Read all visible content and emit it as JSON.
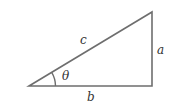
{
  "diagram": {
    "type": "right-triangle",
    "labels": {
      "hypotenuse": "c",
      "opposite": "a",
      "adjacent": "b",
      "angle": "θ"
    },
    "stroke_color": "#6e6e6e"
  }
}
